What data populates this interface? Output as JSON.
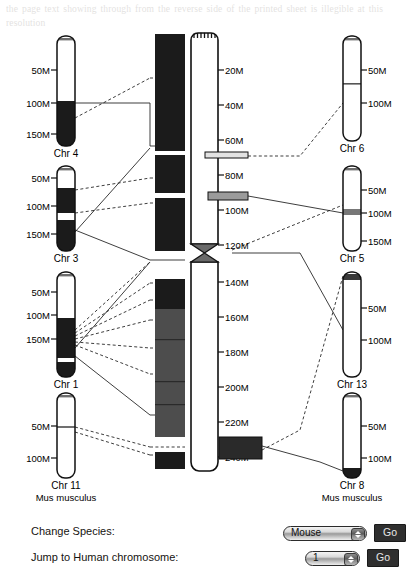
{
  "figure": {
    "type": "comparative-chromosome-map",
    "center": {
      "name": "center-ideogram",
      "ticks": [
        "20M",
        "40M",
        "60M",
        "80M",
        "100M",
        "120M",
        "140M",
        "160M",
        "180M",
        "200M",
        "220M",
        "240M"
      ],
      "tick_values": [
        20,
        40,
        60,
        80,
        100,
        120,
        140,
        160,
        180,
        200,
        220,
        240
      ],
      "axis_max": 250,
      "centromere_at": "120M"
    },
    "left_column": [
      {
        "label": "Chr 4",
        "ticks": [
          "50M",
          "100M",
          "150M"
        ]
      },
      {
        "label": "Chr 3",
        "ticks": [
          "50M",
          "100M",
          "150M"
        ]
      },
      {
        "label": "Chr 1",
        "ticks": [
          "50M",
          "100M",
          "150M"
        ]
      },
      {
        "label": "Chr 11",
        "ticks": [
          "50M",
          "100M"
        ]
      }
    ],
    "right_column": [
      {
        "label": "Chr 6",
        "ticks": [
          "50M",
          "100M"
        ]
      },
      {
        "label": "Chr 5",
        "ticks": [
          "50M",
          "100M",
          "150M"
        ]
      },
      {
        "label": "Chr 13",
        "ticks": [
          "50M",
          "100M"
        ]
      },
      {
        "label": "Chr 8",
        "ticks": [
          "50M",
          "100M"
        ]
      }
    ],
    "left_species_label": "Mus musculus",
    "right_species_label": "Mus musculus"
  },
  "controls": {
    "change_species_label": "Change Species:",
    "species_value": "Mouse",
    "species_go_label": "Go",
    "jump_label": "Jump to Human chromosome:",
    "jump_value": "1",
    "jump_go_label": "Go"
  },
  "colors": {
    "ink": "#000000",
    "band_dark": "#1b1b1b",
    "band_mid": "#4d4d4d",
    "button_bg": "#2f2f2f",
    "button_text": "#e8e8e8"
  },
  "ghost_text": "the page text showing through from the reverse side of the printed sheet is illegible at this resolution"
}
